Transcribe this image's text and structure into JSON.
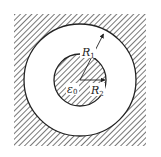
{
  "diagram": {
    "type": "concentric-spheres-cross-section",
    "colors": {
      "background": "#ffffff",
      "hatch": "#555555",
      "stroke": "#222222",
      "gap": "#ffffff"
    },
    "outer_region": {
      "label": "",
      "fill": "hatched"
    },
    "gap_region": {
      "label": "",
      "fill": "empty"
    },
    "inner_sphere": {
      "fill": "hatched"
    },
    "labels": {
      "outer_radius": {
        "main": "R",
        "sub": "1"
      },
      "inner_radius": {
        "main": "R",
        "sub": "2"
      },
      "permittivity": {
        "main": "ε",
        "sub": "0"
      }
    }
  }
}
